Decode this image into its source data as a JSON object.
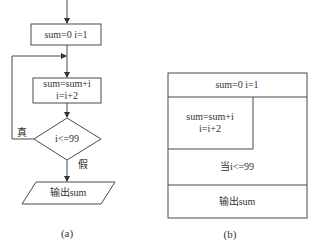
{
  "diagram_a": {
    "caption": "(a)",
    "init_box": "sum=0 i=1",
    "body_line1": "sum=sum+i",
    "body_line2": "i=i+2",
    "condition": "i<=99",
    "true_label": "真",
    "false_label": "假",
    "output": "输出sum"
  },
  "diagram_b": {
    "caption": "(b)",
    "init_row": "sum=0 i=1",
    "body_line1": "sum=sum+i",
    "body_line2": "i=i+2",
    "loop_condition": "当i<=99",
    "output_row": "输出sum"
  },
  "colors": {
    "line": "#4a4a4a",
    "background": "#ffffff"
  }
}
